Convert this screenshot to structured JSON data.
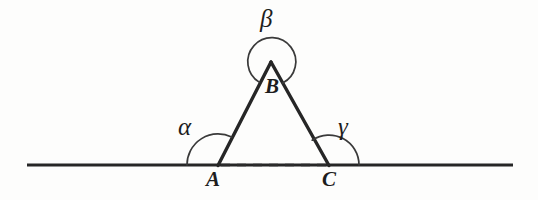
{
  "figure": {
    "kind": "geometry-diagram",
    "background_color": "#fdfdfc",
    "ink_color": "#1d1d1d",
    "stroke_color": "#262626",
    "arc_color": "#3a3a3a"
  },
  "labels": {
    "alpha": "α",
    "beta": "β",
    "gamma": "γ",
    "vertex_a": "A",
    "vertex_b": "B",
    "vertex_c": "C"
  },
  "geometry": {
    "baseline": {
      "x1": 27,
      "y1": 165,
      "x2": 513,
      "y2": 165,
      "stroke_width": 3.2
    },
    "points": {
      "A": {
        "x": 218,
        "y": 165
      },
      "B": {
        "x": 271,
        "y": 62
      },
      "C": {
        "x": 329,
        "y": 165
      }
    },
    "sides": {
      "AB": {
        "stroke_width": 3.4
      },
      "BC": {
        "stroke_width": 3.4
      },
      "AC_dashed": {
        "stroke_width": 2.6,
        "dash_pattern": "9 7"
      }
    },
    "arcs": {
      "alpha": {
        "center_x": 218,
        "center_y": 165,
        "radius": 31,
        "stroke_width": 1.6
      },
      "beta": {
        "center_x": 271,
        "center_y": 62,
        "radius": 24,
        "stroke_width": 1.6,
        "reflex": true
      },
      "gamma": {
        "center_x": 329,
        "center_y": 165,
        "radius": 30,
        "stroke_width": 1.6
      }
    }
  }
}
